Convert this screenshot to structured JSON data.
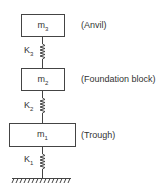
{
  "diagram": {
    "masses": [
      {
        "id": "m3",
        "symbol": "m",
        "sub": "3",
        "description": "(Anvil)"
      },
      {
        "id": "m2",
        "symbol": "m",
        "sub": "2",
        "description": "(Foundation block)"
      },
      {
        "id": "m1",
        "symbol": "m",
        "sub": "1",
        "description": "(Trough)"
      }
    ],
    "springs": [
      {
        "id": "K3",
        "symbol": "K",
        "sub": "3"
      },
      {
        "id": "K2",
        "symbol": "K",
        "sub": "2"
      },
      {
        "id": "K1",
        "symbol": "K",
        "sub": "1"
      }
    ],
    "ground": "fixed-ground"
  }
}
